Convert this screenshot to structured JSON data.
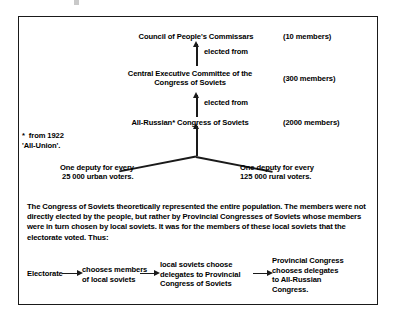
{
  "diagram": {
    "hierarchy": {
      "council": {
        "label": "Council of People's Commissars",
        "members": "(10 members)"
      },
      "central_executive_committee": {
        "label": "Central Executive Committee of the\nCongress of Soviets",
        "members": "(300 members)"
      },
      "congress": {
        "label": "All-Russian* Congress of Soviets",
        "members": "(2000 members)"
      },
      "connector_label_1": "elected from",
      "connector_label_2": "elected from"
    },
    "footnote": "*  from 1922\n'All-Union'.",
    "deputies": {
      "urban": "One deputy for every\n 25 000 urban voters.",
      "rural": "One deputy for every\n125 000 rural voters."
    },
    "paragraph": "The Congress of Soviets theoretically represented the entire population. The members were not directly elected by the people, but rather by Provincial Congresses of Soviets whose members were in turn chosen by local soviets. It was for the members of these local soviets that the electorate voted. Thus:",
    "flow": {
      "step_1": "Electorate",
      "step_2": "chooses members\nof local soviets",
      "step_3": "local soviets choose\ndelegates to Provincial\nCongress of Soviets",
      "step_4": "Provincial Congress\nchooses delegates\nto All-Russian\nCongress."
    }
  },
  "colors": {
    "ink": "#1a1a1a",
    "background": "#ffffff"
  }
}
